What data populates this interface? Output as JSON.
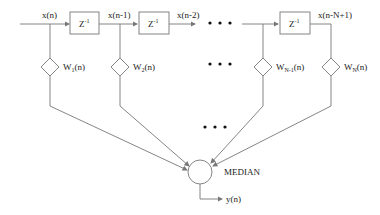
{
  "diagram": {
    "title": "",
    "inputs": {
      "x0": "x(n)",
      "x1": "x(n-1)",
      "x2": "x(n-2)",
      "xlast": "x(n-N+1)"
    },
    "delay_blocks": [
      {
        "label": "Z",
        "exp": "-1"
      },
      {
        "label": "Z",
        "exp": "-1"
      },
      {
        "label": "Z",
        "exp": "-1"
      }
    ],
    "weights": [
      {
        "w": "W",
        "sub": "1",
        "arg": "(n)"
      },
      {
        "w": "W",
        "sub": "2",
        "arg": "(n)"
      },
      {
        "w": "W",
        "sub": "N-1",
        "arg": "(n)"
      },
      {
        "w": "W",
        "sub": "N",
        "arg": "(n)"
      }
    ],
    "combiner": {
      "label": "MEDIAN"
    },
    "output": {
      "label": "y(n)"
    },
    "ellipsis": "• • •"
  }
}
